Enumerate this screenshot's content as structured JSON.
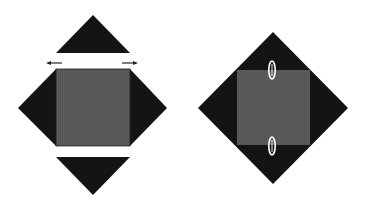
{
  "colors": {
    "background": "#ffffff",
    "dark": "#141414",
    "square": "#5a5a5a",
    "clip_stroke": "#ffffff"
  },
  "figures": [
    {
      "id": "exploded",
      "description": "Square with four detached triangular flaps, arrows indicating outward motion"
    },
    {
      "id": "assembled",
      "description": "Square centered on dark diamond, held with two paper clips"
    }
  ]
}
